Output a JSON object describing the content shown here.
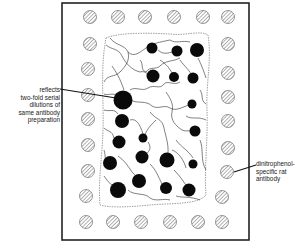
{
  "figure": {
    "type": "gel-immunodiffusion-diagram",
    "annotations": [
      {
        "id": "center-wells",
        "lines": [
          "reflects",
          "two-fold serial",
          "dilutions of",
          "same antibody",
          "preparation"
        ]
      },
      {
        "id": "outer-wells",
        "lines": [
          "dinitrophenol-",
          "specific rat",
          "antibody"
        ]
      }
    ],
    "colors": {
      "frame": "#222222",
      "well_hatch": "#555555",
      "blob": "#0a0a0a",
      "line": "#1a1a1a"
    },
    "outer_wells": {
      "top_row": [
        [
          90,
          17
        ],
        [
          118,
          17
        ],
        [
          145,
          17
        ],
        [
          174,
          17
        ],
        [
          203,
          17
        ],
        [
          228,
          17
        ]
      ],
      "left_col": [
        [
          90,
          44
        ],
        [
          88,
          69
        ],
        [
          88,
          95
        ],
        [
          88,
          119
        ],
        [
          88,
          145
        ],
        [
          88,
          171
        ],
        [
          86,
          196
        ]
      ],
      "right_col": [
        [
          228,
          44
        ],
        [
          228,
          73
        ],
        [
          228,
          97
        ],
        [
          228,
          121
        ],
        [
          228,
          148
        ],
        [
          227,
          172
        ],
        [
          222,
          197
        ]
      ],
      "bottom_row": [
        [
          86,
          222
        ],
        [
          113,
          222
        ],
        [
          141,
          222
        ],
        [
          170,
          222
        ],
        [
          198,
          222
        ],
        [
          222,
          222
        ]
      ],
      "radius": 6.5
    },
    "blobs": [
      {
        "x": 152,
        "y": 48,
        "r": 5.5
      },
      {
        "x": 177,
        "y": 51,
        "r": 5.5
      },
      {
        "x": 197,
        "y": 50,
        "r": 7
      },
      {
        "x": 153,
        "y": 76,
        "r": 6.5
      },
      {
        "x": 174,
        "y": 77,
        "r": 5
      },
      {
        "x": 193,
        "y": 78,
        "r": 5.5
      },
      {
        "x": 123,
        "y": 100,
        "r": 9.5
      },
      {
        "x": 192,
        "y": 104,
        "r": 4.5
      },
      {
        "x": 122,
        "y": 121,
        "r": 7
      },
      {
        "x": 195,
        "y": 131,
        "r": 5.5
      },
      {
        "x": 143,
        "y": 138,
        "r": 4.5
      },
      {
        "x": 119,
        "y": 142,
        "r": 6.5
      },
      {
        "x": 142,
        "y": 157,
        "r": 6.5
      },
      {
        "x": 167,
        "y": 160,
        "r": 7.5
      },
      {
        "x": 110,
        "y": 163,
        "r": 7
      },
      {
        "x": 193,
        "y": 164,
        "r": 4.5
      },
      {
        "x": 139,
        "y": 181,
        "r": 7
      },
      {
        "x": 118,
        "y": 190,
        "r": 8
      },
      {
        "x": 166,
        "y": 188,
        "r": 6
      },
      {
        "x": 189,
        "y": 190,
        "r": 6.5
      }
    ]
  }
}
